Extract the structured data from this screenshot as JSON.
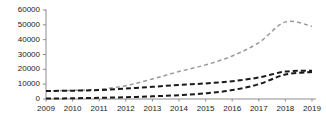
{
  "chart_data": {
    "type": "line",
    "title": "",
    "subtitle": "",
    "xlabel": "",
    "ylabel": "",
    "x": [
      2009,
      2010,
      2011,
      2012,
      2013,
      2014,
      2015,
      2016,
      2017,
      2018,
      2019
    ],
    "categories": [
      "2009",
      "2010",
      "2011",
      "2012",
      "2013",
      "2014",
      "2015",
      "2016",
      "2017",
      "2018",
      "2019"
    ],
    "xlim": [
      2009,
      2019
    ],
    "ylim": [
      0,
      60000
    ],
    "yticks": [
      0,
      10000,
      20000,
      30000,
      40000,
      50000,
      60000
    ],
    "ytick_labels": [
      "0",
      "10000",
      "20000",
      "30000",
      "40000",
      "50000",
      "60000"
    ],
    "xtick_labels": [
      "2009",
      "2010",
      "2011",
      "2012",
      "2013",
      "2014",
      "2015",
      "2016",
      "2017",
      "2018",
      "2019"
    ],
    "grid": false,
    "legend": "none",
    "series": [
      {
        "name": "series-1",
        "style": "dashed",
        "color": "#9a9a9a",
        "values": [
          5500,
          5800,
          6500,
          9000,
          13500,
          18500,
          23000,
          29000,
          38000,
          52000,
          49000
        ]
      },
      {
        "name": "series-2",
        "style": "dashed",
        "color": "#1a1a1a",
        "values": [
          5400,
          5600,
          6000,
          7000,
          8200,
          9500,
          10500,
          12000,
          14500,
          18500,
          19000
        ]
      },
      {
        "name": "series-3",
        "style": "dashed",
        "color": "#1a1a1a",
        "values": [
          300,
          500,
          800,
          1200,
          1800,
          2600,
          3800,
          6000,
          10000,
          16500,
          18200
        ]
      }
    ],
    "axis_color": "#8c8c8c"
  }
}
